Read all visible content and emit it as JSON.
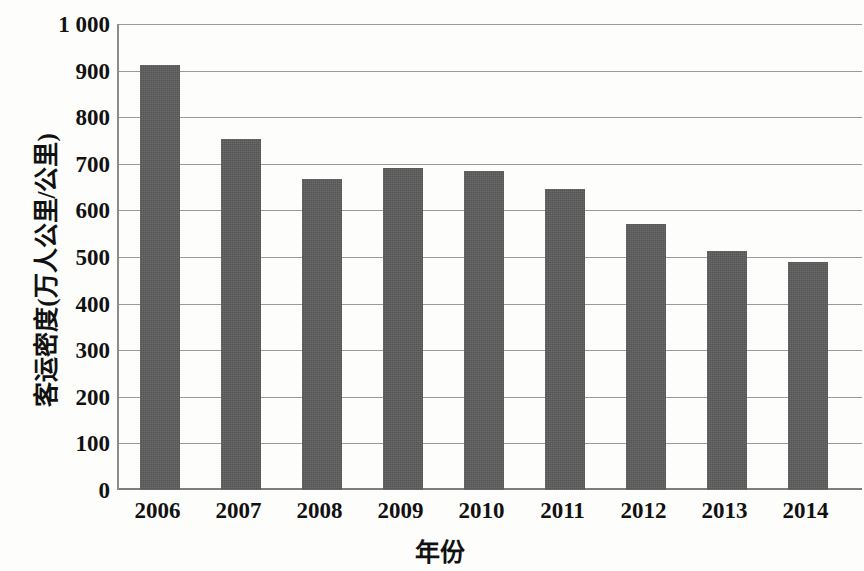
{
  "chart_data": {
    "type": "bar",
    "title": "",
    "xlabel": "年份",
    "ylabel": "客运密度(万人公里/公里)",
    "categories": [
      "2006",
      "2007",
      "2008",
      "2009",
      "2010",
      "2011",
      "2012",
      "2013",
      "2014"
    ],
    "values": [
      912,
      753,
      667,
      690,
      684,
      645,
      570,
      513,
      490
    ],
    "series": [
      {
        "name": "客运密度",
        "values": [
          912,
          753,
          667,
          690,
          684,
          645,
          570,
          513,
          490
        ]
      }
    ],
    "ylim": [
      0,
      1000
    ],
    "ytick_values": [
      0,
      100,
      200,
      300,
      400,
      500,
      600,
      700,
      800,
      900,
      1000
    ],
    "ytick_labels": [
      "0",
      "100",
      "200",
      "300",
      "400",
      "500",
      "600",
      "700",
      "800",
      "900",
      "1 000"
    ],
    "grid": true,
    "legend": false,
    "legend_position": "none",
    "bar_color": "#5d5d5d",
    "gridline_color": "#9a9a9a",
    "background_color": "#fdfdfb"
  }
}
